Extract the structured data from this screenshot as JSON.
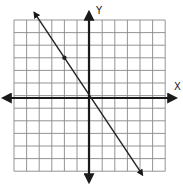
{
  "chart_data": {
    "type": "line",
    "title": "",
    "xlabel": "X",
    "ylabel": "Y",
    "xlim": [
      -6,
      6
    ],
    "ylim": [
      -6,
      6
    ],
    "grid": true,
    "grid_step": 1,
    "series": [
      {
        "name": "line",
        "equation": "y = -3/2 x",
        "slope": -1.5,
        "intercept": 0,
        "points": [
          [
            -2,
            3
          ],
          [
            0,
            0
          ]
        ],
        "marked_point": [
          -2,
          3
        ],
        "arrows_both_ends": true
      }
    ]
  },
  "axes": {
    "x_label": "X",
    "y_label": "Y"
  },
  "colors": {
    "grid": "#888888",
    "axis": "#1a1a1a",
    "line": "#222222",
    "background": "#ffffff"
  }
}
